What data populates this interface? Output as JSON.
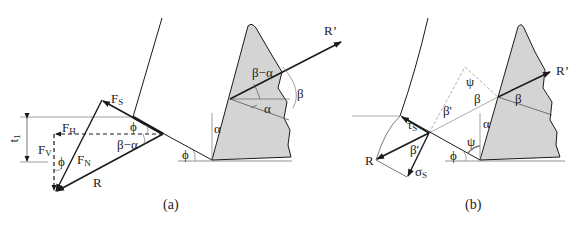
{
  "figure": {
    "panels": [
      {
        "caption": "(a)",
        "labels": {
          "fs": "F",
          "fs_sub": "S",
          "fh": "F",
          "fh_sub": "H",
          "fv": "F",
          "fv_sub": "V",
          "fn": "F",
          "fn_sub": "N",
          "r": "R",
          "t1": "t",
          "t1_sub": "1",
          "phi_top": "ϕ",
          "beta_alpha_tri": "β−α",
          "phi_left": "ϕ",
          "phi_ground": "ϕ",
          "alpha_rake": "α",
          "beta_alpha_tool": "β−α",
          "alpha_tool": "α",
          "beta_tool": "β",
          "r_prime": "R’"
        }
      },
      {
        "caption": "(b)",
        "labels": {
          "tau": "τ",
          "tau_sub": "S",
          "sigma": "σ",
          "sigma_sub": "S",
          "r": "R",
          "beta_prime_lower": "β'",
          "beta_prime_upper": "β'",
          "psi_top": "ψ",
          "beta_mid": "β",
          "beta_tool": "β",
          "alpha": "α",
          "psi_low": "ψ",
          "phi": "ϕ",
          "r_prime": "R’"
        }
      }
    ],
    "colors": {
      "line": "#1a1a1a",
      "thin": "#555555",
      "dashed_gray": "#9a9a9a",
      "tool_fill": "#d4d4d4"
    }
  }
}
